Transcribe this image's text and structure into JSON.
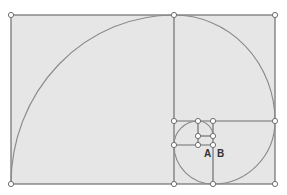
{
  "diagram": {
    "type": "golden-spiral",
    "colors": {
      "fill": "#e6e6e6",
      "line": "#6e6e6e",
      "curve": "#8a8a8a",
      "point_fill": "#ffffff",
      "point_stroke": "#6e6e6e",
      "label": "#333333"
    },
    "labels": [
      {
        "text": "A",
        "x": 204,
        "y": 148
      },
      {
        "text": "B",
        "x": 217,
        "y": 148
      }
    ]
  }
}
